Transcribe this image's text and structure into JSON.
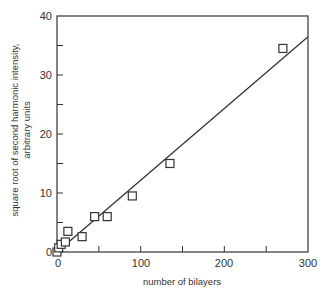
{
  "chart_data": {
    "type": "scatter",
    "title": "",
    "xlabel": "number of bilayers",
    "ylabel_lines": [
      "square root of second harmonic intensity,",
      "arbitrary units"
    ],
    "xlim": [
      0,
      300
    ],
    "ylim": [
      0,
      40
    ],
    "xticks": [
      0,
      100,
      200,
      300
    ],
    "yticks": [
      0,
      10,
      20,
      30,
      40
    ],
    "x_minor_ticks": [
      50,
      150,
      250
    ],
    "y_minor_ticks": [
      5,
      15,
      25,
      35
    ],
    "grid": false,
    "legend": null,
    "series": [
      {
        "name": "measured",
        "marker": "open-square",
        "x": [
          0,
          2,
          5,
          10,
          13,
          30,
          45,
          60,
          90,
          135,
          270
        ],
        "y": [
          0,
          0.7,
          1.3,
          1.7,
          3.5,
          2.6,
          6,
          6,
          9.5,
          15,
          34.5
        ]
      },
      {
        "name": "linear fit",
        "style": "line",
        "x": [
          0,
          300
        ],
        "y": [
          0,
          36.5
        ]
      }
    ]
  },
  "labels": {
    "x_axis": "number of bilayers",
    "y_axis_line1": "square root of second harmonic intensity,",
    "y_axis_line2": "arbitrary units",
    "xtick_0": "0",
    "xtick_100": "100",
    "xtick_200": "200",
    "xtick_300": "300",
    "ytick_0": "0",
    "ytick_10": "10",
    "ytick_20": "20",
    "ytick_30": "30",
    "ytick_40": "40"
  },
  "colors": {
    "ink": "#333333",
    "background": "#ffffff"
  }
}
